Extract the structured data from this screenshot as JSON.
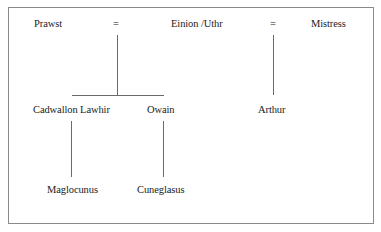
{
  "diagram": {
    "type": "family-tree",
    "row1": {
      "prawst": "Prawst",
      "eq1": "=",
      "einion": "Einion /Uthr",
      "eq2": "=",
      "mistress": "Mistress"
    },
    "row2": {
      "cadwallon": "Cadwallon Lawhir",
      "owain": "Owain",
      "arthur": "Arthur"
    },
    "row3": {
      "maglocunus": "Maglocunus",
      "cuneglasus": "Cuneglasus"
    }
  }
}
